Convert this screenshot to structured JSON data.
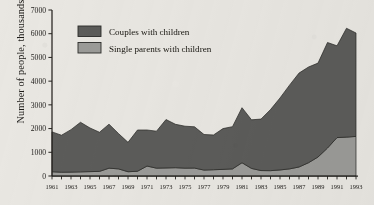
{
  "chart_data": {
    "type": "area",
    "stacked": true,
    "title": "",
    "xlabel": "",
    "ylabel": "Number of people, thousands",
    "ylim": [
      0,
      7000
    ],
    "ytick_labels": [
      "0",
      "1000",
      "2000",
      "3000",
      "4000",
      "5000",
      "6000",
      "7000"
    ],
    "ytick_values": [
      0,
      1000,
      2000,
      3000,
      4000,
      5000,
      6000,
      7000
    ],
    "xlim": [
      1961,
      1993
    ],
    "grid": false,
    "legend_position": "top-left",
    "x": [
      1961,
      1962,
      1963,
      1964,
      1965,
      1966,
      1967,
      1968,
      1969,
      1970,
      1971,
      1972,
      1973,
      1974,
      1975,
      1976,
      1977,
      1978,
      1979,
      1980,
      1981,
      1982,
      1983,
      1984,
      1985,
      1986,
      1987,
      1988,
      1989,
      1990,
      1991,
      1992,
      1993
    ],
    "xtick_labels": [
      "1961",
      "1963",
      "1965",
      "1967",
      "1969",
      "1971",
      "1973",
      "1975",
      "1977",
      "1979",
      "1981",
      "1983",
      "1985",
      "1987",
      "1989",
      "1991",
      "1993"
    ],
    "xtick_values": [
      1961,
      1963,
      1965,
      1967,
      1969,
      1971,
      1973,
      1975,
      1977,
      1979,
      1981,
      1983,
      1985,
      1987,
      1989,
      1991,
      1993
    ],
    "series": [
      {
        "name": "Single parents with children",
        "color": "#9b9b98",
        "values": [
          180,
          160,
          165,
          175,
          185,
          195,
          330,
          300,
          180,
          200,
          420,
          330,
          340,
          350,
          330,
          335,
          250,
          265,
          280,
          300,
          560,
          320,
          230,
          225,
          255,
          300,
          380,
          560,
          800,
          1180,
          1620,
          1640,
          1670
        ]
      },
      {
        "name": "Couples with children",
        "color": "#5c5c5a",
        "values": [
          1680,
          1560,
          1790,
          2090,
          1840,
          1650,
          1855,
          1490,
          1240,
          1740,
          1520,
          1560,
          2040,
          1830,
          1770,
          1740,
          1500,
          1465,
          1720,
          1780,
          2320,
          2050,
          2170,
          2575,
          3035,
          3530,
          3960,
          4035,
          3960,
          4450,
          3870,
          4590,
          4360
        ]
      }
    ],
    "totals": [
      1860,
      1720,
      1955,
      2265,
      2025,
      1845,
      2185,
      1790,
      1420,
      1940,
      1940,
      1890,
      2380,
      2180,
      2100,
      2075,
      1750,
      1730,
      2000,
      2080,
      2880,
      2370,
      2400,
      2800,
      3290,
      3830,
      4340,
      4595,
      4760,
      5630,
      5490,
      6230,
      6030
    ]
  },
  "legend": {
    "items": [
      {
        "label": "Couples with children",
        "color": "#5c5c5a"
      },
      {
        "label": "Single parents with children",
        "color": "#9b9b98"
      }
    ]
  },
  "axis": {
    "y_title": "Number of people, thousands"
  }
}
